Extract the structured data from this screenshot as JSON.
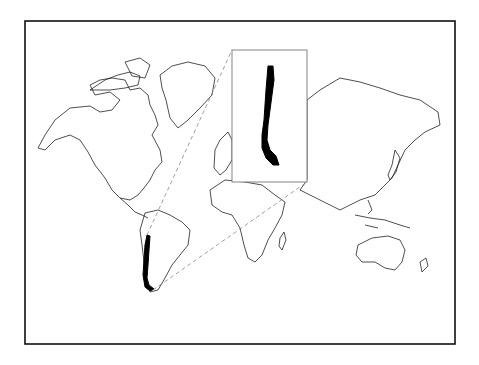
{
  "map": {
    "title": "",
    "projection": "world-outline",
    "highlighted_region": "Chile",
    "highlight_color": "#000000",
    "outline_color": "#222222",
    "leader_line_color": "#888888",
    "inset": {
      "label": "",
      "content": "Chile (enlarged)"
    }
  }
}
